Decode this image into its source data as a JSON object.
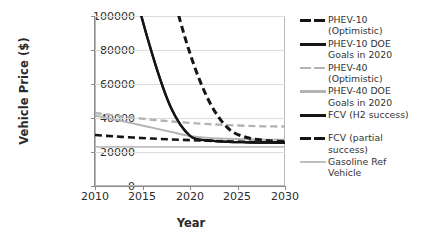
{
  "chart_data": {
    "type": "line",
    "title": "",
    "xlabel": "Year",
    "ylabel": "Vehicle Price ($)",
    "xlim": [
      2010,
      2030
    ],
    "ylim": [
      0,
      100000
    ],
    "xticks": [
      "2010",
      "2015",
      "2020",
      "2025",
      "2030"
    ],
    "yticks": [
      "0",
      "20000",
      "40000",
      "60000",
      "80000",
      "100000"
    ],
    "grid": true,
    "legend_position": "right",
    "x": [
      2010,
      2012,
      2014,
      2016,
      2018,
      2020,
      2022,
      2024,
      2026,
      2028,
      2030
    ],
    "series": [
      {
        "name": "PHEV-10 (Optimistic)",
        "style": "dashed",
        "color": "#151515",
        "values": [
          30000,
          29200,
          28500,
          27900,
          27400,
          27000,
          26600,
          26300,
          26000,
          25800,
          25600
        ]
      },
      {
        "name": "PHEV-10 DOE Goals in 2020",
        "style": "solid",
        "color": "#151515",
        "values": [
          250000,
          180000,
          120000,
          78000,
          46000,
          29500,
          26800,
          26000,
          25700,
          25500,
          25400
        ]
      },
      {
        "name": "PHEV-40 (Optimistic)",
        "style": "dashed",
        "color": "#b3b3b3",
        "values": [
          43000,
          41500,
          40200,
          39000,
          38000,
          37100,
          36400,
          35800,
          35400,
          35100,
          35000
        ]
      },
      {
        "name": "PHEV-40 DOE Goals in 2020",
        "style": "solid",
        "color": "#b3b3b3",
        "values": [
          41500,
          39200,
          36800,
          34300,
          31800,
          29400,
          28300,
          27800,
          27500,
          27300,
          27200
        ]
      },
      {
        "name": "FCV (H2 success)",
        "style": "solid",
        "color": "#151515",
        "values": [
          250000,
          180000,
          120000,
          78000,
          46000,
          29500,
          26800,
          26000,
          25700,
          25500,
          25400
        ]
      },
      {
        "name": "FCV (partial success)",
        "style": "dashed",
        "color": "#151515",
        "values": [
          420000,
          330000,
          240000,
          170000,
          118000,
          78000,
          50000,
          34000,
          28500,
          26800,
          26200
        ]
      },
      {
        "name": "Gasoline Ref Vehicle",
        "style": "solid",
        "color": "#bfbfbf",
        "values": [
          23000,
          23000,
          23000,
          23000,
          23000,
          23000,
          23000,
          23000,
          23000,
          23000,
          23000
        ]
      }
    ]
  },
  "axes": {
    "ylabel": "Vehicle Price ($)",
    "xlabel": "Year",
    "yticks": [
      "100000",
      "80000",
      "60000",
      "40000",
      "20000",
      "0"
    ],
    "xticks": [
      "2010",
      "2015",
      "2020",
      "2025",
      "2030"
    ]
  },
  "legend": {
    "entries": [
      {
        "label": "PHEV-10\n(Optimistic)",
        "marker": "dashed-black"
      },
      {
        "label": "PHEV-10 DOE\nGoals in 2020",
        "marker": "solid-black"
      },
      {
        "label": "PHEV-40\n(Optimistic)",
        "marker": "dashed-gray"
      },
      {
        "label": "PHEV-40 DOE\nGoals in 2020",
        "marker": "solid-gray"
      },
      {
        "label": "FCV (H2 success)",
        "marker": "solid-black"
      },
      {
        "label": "FCV (partial\nsuccess)",
        "marker": "dashed-black"
      },
      {
        "label": "Gasoline Ref\nVehicle",
        "marker": "solid-gray-light"
      }
    ]
  }
}
